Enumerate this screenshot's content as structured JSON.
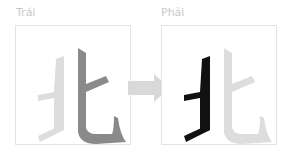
{
  "panels": [
    {
      "label": "Trái",
      "character": "北",
      "highlight": "right-half",
      "highlight_color": "#888888",
      "base_color": "#dddddd"
    },
    {
      "label": "Phải",
      "character": "北",
      "highlight": "left-half",
      "highlight_color": "#111111",
      "base_color": "#dddddd"
    }
  ],
  "arrow": {
    "direction": "right",
    "color": "#d9d9d9"
  }
}
